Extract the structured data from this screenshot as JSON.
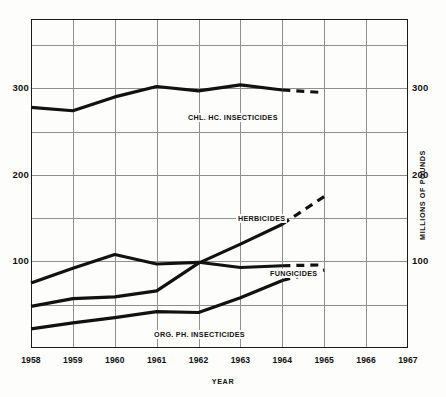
{
  "chart_data": {
    "type": "line",
    "title": "",
    "xlabel": "YEAR",
    "ylabel": "MILLIONS OF POUNDS",
    "xlim": [
      1958,
      1967
    ],
    "ylim": [
      0,
      380
    ],
    "xticks": [
      "1958",
      "1959",
      "1960",
      "1961",
      "1962",
      "1963",
      "1964",
      "1965",
      "1966",
      "1967"
    ],
    "yticks_labeled": [
      "100",
      "200",
      "300"
    ],
    "ygrid_values": [
      50,
      100,
      150,
      200,
      250,
      300,
      350
    ],
    "grid": "on",
    "legend_position": "inline-callouts",
    "axis_right_mirrored": true,
    "note": "Solid segments are reported data; dashed segments are projected/estimated.",
    "series": [
      {
        "name": "CHL. HC. INSECTICIDES",
        "label": "CHL. HC. INSECTICIDES",
        "style": "solid-then-dashed",
        "solid_x": [
          1958,
          1959,
          1960,
          1961,
          1962,
          1963,
          1964
        ],
        "solid_values": [
          278,
          274,
          290,
          302,
          297,
          304,
          298
        ],
        "dashed_x": [
          1964,
          1965
        ],
        "dashed_values": [
          298,
          295
        ]
      },
      {
        "name": "HERBICIDES",
        "label": "HERBICIDES",
        "style": "solid-then-dashed",
        "solid_x": [
          1958,
          1959,
          1960,
          1961,
          1962,
          1963,
          1964
        ],
        "solid_values": [
          48,
          57,
          59,
          66,
          98,
          120,
          143
        ],
        "dashed_x": [
          1964,
          1965
        ],
        "dashed_values": [
          143,
          175
        ]
      },
      {
        "name": "FUNGICIDES",
        "label": "FUNGICIDES",
        "style": "solid-then-dashed",
        "solid_x": [
          1958,
          1959,
          1960,
          1961,
          1962,
          1963,
          1964
        ],
        "solid_values": [
          75,
          92,
          108,
          97,
          99,
          93,
          95
        ],
        "dashed_x": [
          1964,
          1965
        ],
        "dashed_values": [
          95,
          96
        ]
      },
      {
        "name": "ORG. PH. INSECTICIDES",
        "label": "ORG. PH. INSECTICIDES",
        "style": "solid-then-dashed",
        "solid_x": [
          1958,
          1959,
          1960,
          1961,
          1962,
          1963,
          1964
        ],
        "solid_values": [
          22,
          29,
          35,
          42,
          41,
          58,
          78
        ],
        "dashed_x": [
          1964,
          1965
        ],
        "dashed_values": [
          78,
          90
        ]
      }
    ]
  },
  "axes": {
    "x_title": "YEAR",
    "y_title": "MILLIONS OF POUNDS",
    "x_tick_labels": [
      "1958",
      "1959",
      "1960",
      "1961",
      "1962",
      "1963",
      "1964",
      "1965",
      "1966",
      "1967"
    ],
    "y_tick_labels_left": [
      "300",
      "200",
      "100"
    ],
    "y_tick_labels_right": [
      "300",
      "200",
      "100"
    ]
  },
  "callouts": {
    "chl_hc": "CHL. HC. INSECTICIDES",
    "herbicides": "HERBICIDES",
    "fungicides": "FUNGICIDES",
    "org_ph": "ORG. PH. INSECTICIDES"
  },
  "colors": {
    "line": "#111111",
    "grid": "#8f8f8f",
    "frame": "#1a1a1a",
    "background": "#fdfdfc",
    "text": "#111111"
  }
}
